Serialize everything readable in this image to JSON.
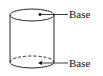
{
  "diagram": {
    "shape": "cylinder",
    "labels": [
      {
        "id": "top",
        "text": "Base"
      },
      {
        "id": "bottom",
        "text": "Base"
      }
    ],
    "colors": {
      "stroke": "#111111",
      "background": "#ffffff"
    }
  }
}
